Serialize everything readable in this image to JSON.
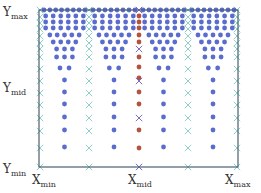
{
  "labels": {
    "y_max": {
      "base": "Y",
      "sub": "max"
    },
    "y_mid": {
      "base": "Y",
      "sub": "mid"
    },
    "y_min": {
      "base": "Y",
      "sub": "min"
    },
    "x_min": {
      "base": "X",
      "sub": "min"
    },
    "x_mid": {
      "base": "X",
      "sub": "mid"
    },
    "x_max": {
      "base": "X",
      "sub": "max"
    }
  },
  "colors": {
    "frame": "#4a6070",
    "blue_dot": "#5b6ccf",
    "red_dot": "#b5523e",
    "teal_cross": "#8fd0c8",
    "purple_cross": "#7a6cc8"
  },
  "frame": {
    "x0": 39,
    "y0": 10,
    "x1": 238,
    "y1": 167
  },
  "cross_columns": {
    "teal": [
      40,
      89,
      188,
      237
    ],
    "purple": [
      139
    ],
    "rows": [
      10,
      17,
      23,
      29,
      36,
      43,
      49,
      57,
      69,
      81,
      93,
      105,
      118,
      131,
      148,
      167
    ]
  },
  "center_column": {
    "x": 139,
    "red_rows": [
      16,
      22,
      28,
      35,
      42,
      57,
      67,
      78,
      92,
      104,
      130,
      148
    ],
    "purple_cross_rows": [
      10,
      49,
      81,
      118,
      167
    ]
  },
  "blue_blocks": [
    {
      "x0": 44,
      "x1": 85
    },
    {
      "x0": 93,
      "x1": 135
    },
    {
      "x0": 143,
      "x1": 184
    },
    {
      "x0": 192,
      "x1": 234
    }
  ],
  "block_rows": [
    {
      "y": 10,
      "n": 8
    },
    {
      "y": 16,
      "n": 6
    },
    {
      "y": 22,
      "n": 6
    },
    {
      "y": 28,
      "n": 6
    },
    {
      "y": 35,
      "n": 5
    },
    {
      "y": 42,
      "n": 4
    },
    {
      "y": 49,
      "n": 3
    },
    {
      "y": 57,
      "n": 3
    },
    {
      "y": 68,
      "n": 2
    },
    {
      "y": 80,
      "n": 1
    },
    {
      "y": 92,
      "n": 1
    },
    {
      "y": 104,
      "n": 1
    },
    {
      "y": 117,
      "n": 1
    },
    {
      "y": 130,
      "n": 1
    },
    {
      "y": 147,
      "n": 1
    }
  ]
}
